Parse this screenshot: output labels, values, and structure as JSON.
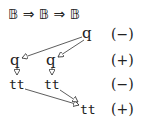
{
  "header": {
    "type_expr": "𝔹 ⇒ 𝔹 ⇒ 𝔹"
  },
  "nodes": [
    {
      "id": "n1",
      "label": "q",
      "row": 1
    },
    {
      "id": "n2",
      "label": "q",
      "row": 2
    },
    {
      "id": "n3",
      "label": "q",
      "row": 2
    },
    {
      "id": "n4",
      "label": "tt",
      "row": 3
    },
    {
      "id": "n5",
      "label": "tt",
      "row": 3
    },
    {
      "id": "n6",
      "label": "tt",
      "row": 4
    }
  ],
  "polarities": [
    "(−)",
    "(+)",
    "(−)",
    "(+)"
  ],
  "edges": [
    {
      "from": "n1",
      "to": "n2"
    },
    {
      "from": "n1",
      "to": "n3"
    },
    {
      "from": "n2",
      "to": "n4"
    },
    {
      "from": "n3",
      "to": "n5"
    },
    {
      "from": "n4",
      "to": "n6"
    },
    {
      "from": "n5",
      "to": "n6"
    }
  ]
}
